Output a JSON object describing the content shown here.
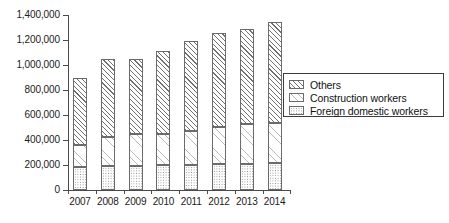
{
  "chart_data": {
    "type": "bar",
    "subtype": "stacked-bar",
    "title": "",
    "xlabel": "",
    "ylabel": "",
    "categories": [
      "2007",
      "2008",
      "2009",
      "2010",
      "2011",
      "2012",
      "2013",
      "2014"
    ],
    "series": [
      {
        "name": "Foreign domestic workers",
        "pattern": "dotted",
        "values": [
          187000,
          192000,
          194000,
          199000,
          201000,
          206000,
          212000,
          217000
        ]
      },
      {
        "name": "Construction workers",
        "pattern": "light-diagonal-hatch",
        "values": [
          173000,
          231000,
          258000,
          253000,
          268000,
          296000,
          320000,
          318000
        ]
      },
      {
        "name": "Others",
        "pattern": "diagonal-hatch",
        "values": [
          536000,
          627000,
          598000,
          660000,
          723000,
          754000,
          756000,
          809000
        ]
      }
    ],
    "totals": [
      896000,
      1050000,
      1050000,
      1112000,
      1192000,
      1256000,
      1288000,
      1344000
    ],
    "ylim": [
      0,
      1400000
    ],
    "ytick_values": [
      0,
      200000,
      400000,
      600000,
      800000,
      1000000,
      1200000,
      1400000
    ],
    "ytick_labels": [
      "0",
      "200,000",
      "400,000",
      "600,000",
      "800,000",
      "1,000,000",
      "1,200,000",
      "1,400,000"
    ],
    "grid": false,
    "legend_position": "right",
    "legend_entries": [
      "Others",
      "Construction workers",
      "Foreign domestic workers"
    ],
    "colors": {
      "axis": "#4a4a4a",
      "outline": "#6b6b6b",
      "text": "#111111",
      "background": "#ffffff"
    }
  }
}
